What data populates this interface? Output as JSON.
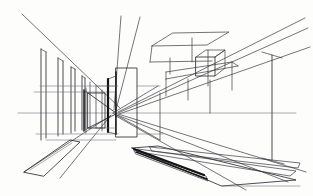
{
  "document": {
    "title": "One-Point Perspective Architectural Sketch",
    "medium": "pen on paper",
    "subject": "interior corridor / colonnade with suspended volumes",
    "background_color": "#fdfdfc",
    "ink_color": "#2b2b2f",
    "width": 313,
    "height": 196
  },
  "geometry": {
    "vanishing_point": {
      "x": 113,
      "y": 113
    },
    "horizon_line": {
      "y": 113,
      "x_start": 18,
      "x_end": 296
    }
  },
  "layers": [
    {
      "name": "horizon-line",
      "label": "Horizon line"
    },
    {
      "name": "left-colonnade",
      "label": "Left receding colonnade"
    },
    {
      "name": "central-block",
      "label": "Central vertical block"
    },
    {
      "name": "inner-aperture",
      "label": "Inner aperture box"
    },
    {
      "name": "ceiling-plane",
      "label": "Upper right ceiling plane"
    },
    {
      "name": "suspended-cube",
      "label": "Suspended cube volume"
    },
    {
      "name": "drop-rods",
      "label": "Vertical drop rods"
    },
    {
      "name": "right-pier",
      "label": "Right tall pier"
    },
    {
      "name": "floor-plane-left",
      "label": "Left floor plane"
    },
    {
      "name": "floor-planes-right",
      "label": "Right floor ramp planes"
    },
    {
      "name": "perspective-rays",
      "label": "Convergence construction rays"
    }
  ],
  "paths": {
    "horizon": "M18,113 L296,113",
    "ray_top_left": "M22,14 L120,108",
    "ray_upper_mid": "M121,16 L114,110",
    "ray_upper_mid2": "M140,17 L116,110",
    "ray_tr_1": "M305,18 L118,112",
    "ray_tr_2": "M308,28 L118,113",
    "ray_tr_3": "M310,47 L119,114",
    "ray_br_1": "M118,114 L306,172",
    "ray_br_2": "M117,115 L288,182",
    "ray_br_3": "M116,116 L246,190",
    "ray_bl_1": "M110,116 L24,172",
    "ray_bl_2": "M111,115 L60,178",
    "ray_x_1": "M88,93 L116,113",
    "ray_x_2": "M88,128 L116,114",
    "ray_x_3": "M113,113 L158,86",
    "ray_x_4": "M113,113 L160,140",
    "col_1": "M41,49 L41,140",
    "col_1b": "M46,52 L46,138",
    "col_1top": "M41,49 L46,52",
    "col_2": "M58,58 L58,136",
    "col_2b": "M63,61 L63,134",
    "col_2top": "M58,58 L63,61",
    "col_3": "M71,67 L71,133",
    "col_3b": "M75,69 L75,131",
    "col_3top": "M71,67 L75,69",
    "col_4": "M82,76 L82,130",
    "col_4b": "M85,78 L85,129",
    "col_4top": "M82,76 L85,78",
    "col_5": "M90,82 L90,129",
    "col_6": "M96,86 L96,128",
    "wall_band_top": "M40,86 L118,86",
    "wall_band_mid": "M34,92 L116,92",
    "wall_band_low": "M36,134 L118,134",
    "wall_band_low2": "M46,140 L116,140",
    "central_rect": "M116,68 L137,68 L137,137 L116,137 Z",
    "central_left_edge": "M116,72 L116,134",
    "central_slab_l": "M108,79 L116,76",
    "central_slab_l2": "M108,79 L108,132",
    "central_slab_b": "M108,132 L116,134",
    "central_top_rail": "M96,86 L116,86",
    "central_bot_rail": "M96,128 L116,128",
    "inner_rect": "M88,93 L105,93 L105,128 L88,128 Z",
    "inner_left": "M84,90 L84,131",
    "inner_top": "M84,90 L88,93",
    "inner_bot": "M84,131 L88,128",
    "post_a": "M86,88 L86,133",
    "post_b": "M102,90 L102,131",
    "right_band_top": "M137,86 L160,86",
    "right_band_bot": "M137,134 L163,134",
    "right_stub_v": "M160,93 L160,140",
    "ceiling_plane": "M173,33 L229,32 L207,45 L152,46 Z",
    "ceiling_edge2": "M152,46 L150,62",
    "ceiling_rail": "M150,62 L212,61",
    "cube_front": "M196,57 L215,57 L215,76 L196,76 Z",
    "cube_top_back": "M196,57 L206,50 L225,50 L215,57",
    "cube_side": "M215,57 L225,50 L225,68 L215,76",
    "soffit_band": "M166,72 L232,62",
    "soffit_band2": "M166,79 L238,66",
    "soffit_v1": "M166,72 L166,79",
    "soffit_v2": "M232,62 L238,66",
    "rod_1": "M192,38 L192,62",
    "rod_2": "M170,58 L170,74",
    "rod_3": "M208,50 L208,86",
    "rod_4": "M166,79 L166,96",
    "rod_5": "M188,79 L188,100",
    "rod_6": "M210,80 L210,113",
    "rod_7": "M232,62 L232,90",
    "right_pier": "M272,55 L272,160",
    "right_pier_cap": "M262,52 L282,58",
    "right_pier_base": "M262,158 L284,164",
    "floor_left": "M24,172 L70,140 L80,142 L44,176 Z",
    "floor_left_in": "M30,170 L72,143",
    "floor_r1": "M132,148 L158,146 L296,180 L222,186 Z",
    "floor_r1_edge": "M132,148 L200,174",
    "floor_r2": "M138,149 L296,171 L290,176 L140,152 Z",
    "floor_r3": "M150,147 L300,163 L298,168 L152,151 Z",
    "floor_r4": "M134,150 L206,176 L208,181 L136,154 Z",
    "floor_r_tail": "M222,186 L300,186",
    "floor_dark_edge": "M134,149 L204,175",
    "floor_dark_edge2": "M136,152 L207,179"
  }
}
